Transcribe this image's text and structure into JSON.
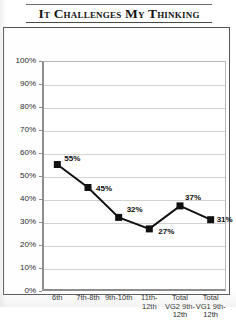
{
  "title": "It Challenges My Thinking",
  "chart_data": {
    "type": "line",
    "title": "It Challenges My Thinking",
    "xlabel": "",
    "ylabel": "",
    "ylim": [
      0,
      100
    ],
    "grid": true,
    "legend": "none",
    "categories": [
      "6th",
      "7th-8th",
      "9th-10th",
      "11th-12th",
      "Total VG2 9th-12th",
      "Total VG1 9th-12th"
    ],
    "category_lines": [
      [
        "6th"
      ],
      [
        "7th-8th"
      ],
      [
        "9th-10th"
      ],
      [
        "11th-",
        "12th"
      ],
      [
        "Total",
        "VG2 9th-",
        "12th"
      ],
      [
        "Total",
        "VG1 9th-",
        "12th"
      ]
    ],
    "values": [
      55,
      45,
      32,
      27,
      37,
      31
    ],
    "point_labels": [
      "55%",
      "45%",
      "32%",
      "27%",
      "37%",
      "31%"
    ],
    "ytick_labels": [
      "100%",
      "90%",
      "80%",
      "70%",
      "60%",
      "50%",
      "40%",
      "30%",
      "20%",
      "10%",
      "0%"
    ],
    "ytick_values": [
      100,
      90,
      80,
      70,
      60,
      50,
      40,
      30,
      20,
      10,
      0
    ],
    "series_color": "#111111",
    "marker": "square",
    "gridline_color": "#d2d2d2",
    "axis_color": "#8d8d8d"
  }
}
